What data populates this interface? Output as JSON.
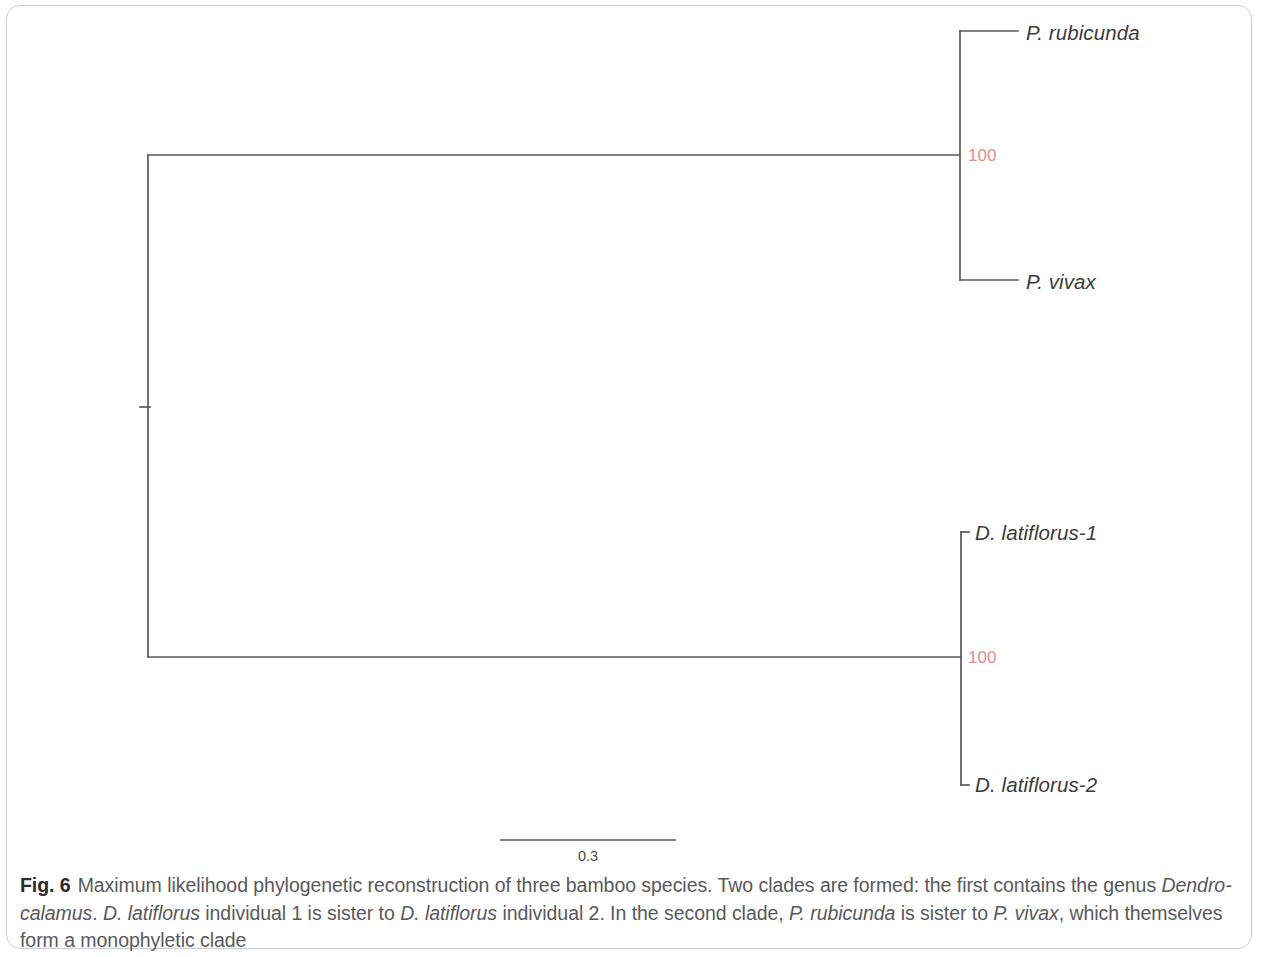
{
  "figure": {
    "number_label": "Fig. 6",
    "caption_lines": [
      {
        "runs": [
          {
            "text": "Maximum likelihood phylogenetic reconstruction of three bamboo species. Two clades are formed: the first contains the genus ",
            "italic": false
          },
          {
            "text": "Dendro-",
            "italic": true
          }
        ]
      },
      {
        "runs": [
          {
            "text": "calamus",
            "italic": true
          },
          {
            "text": ". ",
            "italic": false
          },
          {
            "text": "D. latiflorus",
            "italic": true
          },
          {
            "text": " individual 1 is sister to ",
            "italic": false
          },
          {
            "text": "D. latiflorus",
            "italic": true
          },
          {
            "text": " individual 2. In the second clade, ",
            "italic": false
          },
          {
            "text": "P. rubicunda",
            "italic": true
          },
          {
            "text": " is sister to ",
            "italic": false
          },
          {
            "text": "P. vivax",
            "italic": true
          },
          {
            "text": ", which themselves form a ",
            "italic": false
          }
        ]
      },
      {
        "runs": [
          {
            "text": "monophyletic clade",
            "italic": false
          }
        ]
      }
    ]
  },
  "chart_data": {
    "type": "tree",
    "title": "Maximum likelihood phylogenetic reconstruction of three bamboo species",
    "layout": "rectangular-cladogram",
    "orientation": "left-to-right",
    "line_color": "#5a5a5a",
    "support_color": "#d98f8a",
    "scale_bar": {
      "label": "0.3",
      "value": 0.3,
      "x_start": 500,
      "x_end": 676,
      "y": 840
    },
    "root": {
      "x": 148,
      "y": 407
    },
    "tips": [
      {
        "id": "tip-p-rubicunda",
        "label": "P. rubicunda",
        "x": 1018,
        "y": 31,
        "label_x": 1026,
        "label_y": 21,
        "clade": "Phyllostachys"
      },
      {
        "id": "tip-p-vivax",
        "label": "P. vivax",
        "x": 1018,
        "y": 280,
        "label_x": 1026,
        "label_y": 270,
        "clade": "Phyllostachys"
      },
      {
        "id": "tip-d-latiflorus-1",
        "label": "D. latiflorus-1",
        "x": 969,
        "y": 532,
        "label_x": 975,
        "label_y": 521,
        "clade": "Dendrocalamus"
      },
      {
        "id": "tip-d-latiflorus-2",
        "label": "D. latiflorus-2",
        "x": 969,
        "y": 785,
        "label_x": 975,
        "label_y": 773,
        "clade": "Dendrocalamus"
      }
    ],
    "internal_nodes": [
      {
        "id": "node-root",
        "x": 148,
        "y": 407,
        "support": null
      },
      {
        "id": "node-phyllostachys",
        "x": 960,
        "y": 155,
        "support": "100",
        "support_x": 968,
        "support_y": 146
      },
      {
        "id": "node-dendrocalamus",
        "x": 961,
        "y": 657,
        "support": "100",
        "support_x": 968,
        "support_y": 648
      }
    ],
    "branches": [
      {
        "from": "root-stub",
        "x1": 140,
        "y1": 407,
        "x2": 150,
        "y2": 407
      },
      {
        "from": "node-root",
        "type": "vertical",
        "x1": 148,
        "y1": 155,
        "x2": 148,
        "y2": 657
      },
      {
        "from": "node-root",
        "to": "node-phyllostachys",
        "type": "horizontal",
        "x1": 148,
        "y1": 155,
        "x2": 960,
        "y2": 155
      },
      {
        "from": "node-root",
        "to": "node-dendrocalamus",
        "type": "horizontal",
        "x1": 148,
        "y1": 657,
        "x2": 961,
        "y2": 657
      },
      {
        "from": "node-phyllostachys",
        "type": "vertical",
        "x1": 960,
        "y1": 31,
        "x2": 960,
        "y2": 280
      },
      {
        "from": "node-phyllostachys",
        "to": "tip-p-rubicunda",
        "type": "horizontal",
        "x1": 960,
        "y1": 31,
        "x2": 1018,
        "y2": 31
      },
      {
        "from": "node-phyllostachys",
        "to": "tip-p-vivax",
        "type": "horizontal",
        "x1": 960,
        "y1": 280,
        "x2": 1018,
        "y2": 280
      },
      {
        "from": "node-dendrocalamus",
        "type": "vertical",
        "x1": 961,
        "y1": 532,
        "x2": 961,
        "y2": 785
      },
      {
        "from": "node-dendrocalamus",
        "to": "tip-d-latiflorus-1",
        "type": "horizontal",
        "x1": 961,
        "y1": 532,
        "x2": 969,
        "y2": 532
      },
      {
        "from": "node-dendrocalamus",
        "to": "tip-d-latiflorus-2",
        "type": "horizontal",
        "x1": 961,
        "y1": 785,
        "x2": 969,
        "y2": 785
      }
    ],
    "support_values": [
      "100",
      "100"
    ]
  }
}
